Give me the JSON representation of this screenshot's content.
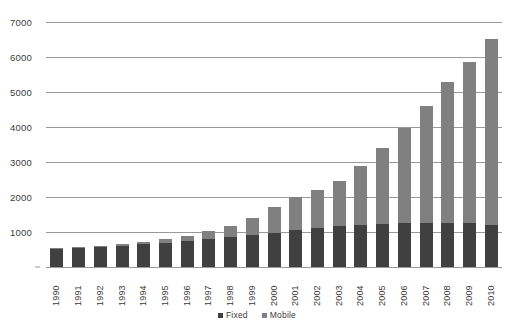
{
  "chart_data": {
    "type": "bar",
    "subtype": "stacked-column",
    "title": "",
    "subtitle": "",
    "xlabel": "",
    "ylabel": "",
    "categories": [
      "1990",
      "1991",
      "1992",
      "1993",
      "1994",
      "1995",
      "1996",
      "1997",
      "1998",
      "1999",
      "2000",
      "2001",
      "2002",
      "2003",
      "2004",
      "2005",
      "2006",
      "2007",
      "2008",
      "2009",
      "2010"
    ],
    "series": [
      {
        "name": "Fixed",
        "color": "#404040",
        "values": [
          520,
          545,
          575,
          610,
          650,
          700,
          750,
          800,
          850,
          920,
          980,
          1050,
          1120,
          1170,
          1200,
          1240,
          1250,
          1270,
          1270,
          1250,
          1200
        ]
      },
      {
        "name": "Mobile",
        "color": "#808080",
        "values": [
          10,
          15,
          25,
          40,
          60,
          90,
          140,
          215,
          320,
          490,
          730,
          960,
          1090,
          1300,
          1700,
          2160,
          2720,
          3340,
          4020,
          4620,
          5320
        ]
      }
    ],
    "totals": [
      530,
      560,
      600,
      650,
      710,
      790,
      890,
      1015,
      1170,
      1410,
      1710,
      2010,
      2210,
      2470,
      2900,
      3400,
      3970,
      4610,
      5290,
      5870,
      6520
    ],
    "yticks": [
      0,
      1000,
      2000,
      3000,
      4000,
      5000,
      6000,
      7000
    ],
    "ytick_labels": [
      "",
      "1000",
      "2000",
      "3000",
      "4000",
      "5000",
      "6000",
      "7000"
    ],
    "ylim": [
      0,
      7000
    ],
    "grid": true,
    "grid_color": "#9a9a9a",
    "legend_position": "bottom",
    "legend": [
      {
        "label": "Fixed",
        "color": "#404040"
      },
      {
        "label": "Mobile",
        "color": "#808080"
      }
    ]
  }
}
